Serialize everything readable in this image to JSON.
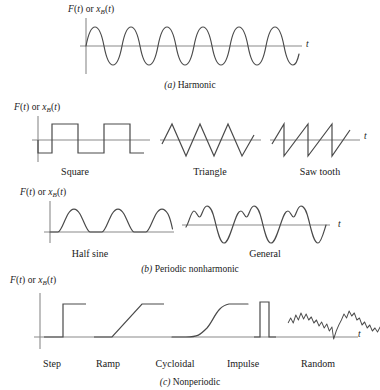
{
  "figure": {
    "axis_label_prefix": "F(t)",
    "axis_label_or": " or ",
    "axis_label_x": "x",
    "axis_label_sub": "B",
    "axis_label_suffix": "(t)",
    "t_axis": "t",
    "stroke_color": "#4a4a4a",
    "axis_color": "#8a8a8a",
    "background": "#ffffff"
  },
  "rows": [
    {
      "caption_letter": "(a)",
      "caption_text": " Harmonic",
      "plots": [
        {
          "name": "Harmonic",
          "label": "",
          "type": "sine",
          "cycles": 6.2,
          "amplitude": 1.0
        }
      ]
    },
    {
      "caption_letter": "(b)",
      "caption_text": " Periodic nonharmonic",
      "plots": [
        {
          "name": "Square",
          "label": "Square",
          "type": "square",
          "cycles": 2.5,
          "amplitude": 1.0
        },
        {
          "name": "Triangle",
          "label": "Triangle",
          "type": "triangle",
          "cycles": 3.5,
          "amplitude": 1.0
        },
        {
          "name": "Saw tooth",
          "label": "Saw tooth",
          "type": "sawtooth",
          "cycles": 3.0,
          "amplitude": 1.0
        }
      ]
    },
    {
      "caption_letter": "(c)",
      "caption_text": " Nonperiodic",
      "plots": [
        {
          "name": "Half sine",
          "label": "Half sine",
          "type": "half-sine",
          "cycles": 3.0,
          "amplitude": 1.0
        },
        {
          "name": "General",
          "label": "General",
          "type": "general-periodic",
          "cycles": 3.0,
          "amplitude": 1.0
        }
      ]
    },
    {
      "caption_letter": "(c)",
      "caption_text": " Nonperiodic",
      "plots": [
        {
          "name": "Step",
          "label": "Step",
          "type": "step",
          "amplitude": 1.0
        },
        {
          "name": "Ramp",
          "label": "Ramp",
          "type": "ramp",
          "amplitude": 1.0
        },
        {
          "name": "Cycloidal",
          "label": "Cycloidal",
          "type": "cycloidal",
          "amplitude": 1.0
        },
        {
          "name": "Impulse",
          "label": "Impulse",
          "type": "impulse",
          "amplitude": 1.0
        },
        {
          "name": "Random",
          "label": "Random",
          "type": "random",
          "amplitude": 1.0
        }
      ]
    }
  ],
  "captions": {
    "a_letter": "(a)",
    "a_text": " Harmonic",
    "b_letter": "(b)",
    "b_text": " Periodic nonharmonic",
    "c_letter": "(c)",
    "c_text": " Nonperiodic"
  },
  "labels": {
    "square": "Square",
    "triangle": "Triangle",
    "sawtooth": "Saw tooth",
    "halfsine": "Half sine",
    "general": "General",
    "step": "Step",
    "ramp": "Ramp",
    "cycloidal": "Cycloidal",
    "impulse": "Impulse",
    "random": "Random"
  }
}
